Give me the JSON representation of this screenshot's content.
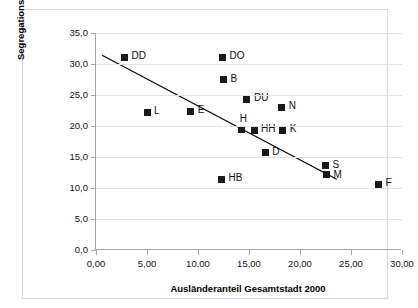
{
  "chart_data": {
    "type": "scatter",
    "title": "",
    "xlabel": "Ausländeranteil Gesamtstadt 2000",
    "ylabel": "Segregationsindex 2000",
    "xlim": [
      0,
      30
    ],
    "ylim": [
      0,
      35
    ],
    "grid": true,
    "legend": "none",
    "x_ticks": [
      "0,00",
      "5,00",
      "10,00",
      "15,00",
      "20,00",
      "25,00",
      "30,00"
    ],
    "x_tick_values": [
      0,
      5,
      10,
      15,
      20,
      25,
      30
    ],
    "y_ticks": [
      "0,0",
      "5,0",
      "10,0",
      "15,0",
      "20,0",
      "25,0",
      "30,0",
      "35,0"
    ],
    "y_tick_values": [
      0,
      5,
      10,
      15,
      20,
      25,
      30,
      35
    ],
    "points": [
      {
        "label": "DD",
        "x": 2.8,
        "y": 31.1,
        "lx": 7,
        "ly": -6
      },
      {
        "label": "L",
        "x": 5.0,
        "y": 22.2,
        "lx": 7,
        "ly": -6
      },
      {
        "label": "E",
        "x": 9.3,
        "y": 22.4,
        "lx": 7,
        "ly": -6
      },
      {
        "label": "HB",
        "x": 12.3,
        "y": 11.4,
        "lx": 7,
        "ly": -6
      },
      {
        "label": "DO",
        "x": 12.4,
        "y": 31.1,
        "lx": 7,
        "ly": -6
      },
      {
        "label": "B",
        "x": 12.5,
        "y": 27.5,
        "lx": 7,
        "ly": -6
      },
      {
        "label": "H",
        "x": 14.3,
        "y": 19.4,
        "lx": -2,
        "ly": -16
      },
      {
        "label": "DU",
        "x": 14.8,
        "y": 24.3,
        "lx": 7,
        "ly": -6
      },
      {
        "label": "HH",
        "x": 15.5,
        "y": 19.3,
        "lx": 7,
        "ly": -6
      },
      {
        "label": "D",
        "x": 16.6,
        "y": 15.7,
        "lx": 7,
        "ly": -6
      },
      {
        "label": "N",
        "x": 18.2,
        "y": 23.0,
        "lx": 7,
        "ly": -6
      },
      {
        "label": "K",
        "x": 18.3,
        "y": 19.3,
        "lx": 7,
        "ly": -6
      },
      {
        "label": "S",
        "x": 22.5,
        "y": 13.6,
        "lx": 7,
        "ly": -6
      },
      {
        "label": "M",
        "x": 22.6,
        "y": 12.1,
        "lx": 7,
        "ly": -5
      },
      {
        "label": "F",
        "x": 27.7,
        "y": 10.6,
        "lx": 7,
        "ly": -6
      }
    ],
    "trendline": {
      "x1": 0.6,
      "y1": 31.4,
      "x2": 23.6,
      "y2": 11.4
    }
  }
}
